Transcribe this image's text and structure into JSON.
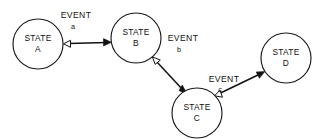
{
  "diagram": {
    "type": "state-machine",
    "background_color": "#ffffff",
    "stroke_color": "#121212",
    "states": [
      {
        "id": "A",
        "line1": "STATE",
        "line2": "A",
        "cx": 38,
        "cy": 44,
        "r": 25
      },
      {
        "id": "B",
        "line1": "STATE",
        "line2": "B",
        "cx": 136,
        "cy": 38,
        "r": 25
      },
      {
        "id": "C",
        "line1": "STATE",
        "line2": "C",
        "cx": 197,
        "cy": 113,
        "r": 25
      },
      {
        "id": "D",
        "line1": "STATE",
        "line2": "D",
        "cx": 286,
        "cy": 58,
        "r": 25
      }
    ],
    "transitions": [
      {
        "id": "a",
        "from": "A",
        "to": "B",
        "label": "EVENT",
        "sublabel": "a",
        "label_x": 76,
        "label_y": 18,
        "sublabel_x": 73,
        "sublabel_y": 29,
        "x1": 63,
        "y1": 44,
        "x2": 111,
        "y2": 42
      },
      {
        "id": "b",
        "from": "B",
        "to": "C",
        "label": "EVENT",
        "sublabel": "b",
        "label_x": 183,
        "label_y": 41,
        "sublabel_x": 179,
        "sublabel_y": 52,
        "x1": 153,
        "y1": 57,
        "x2": 186,
        "y2": 93
      },
      {
        "id": "c",
        "from": "C",
        "to": "D",
        "label": "EVENT",
        "sublabel": "c",
        "label_x": 224,
        "label_y": 82,
        "sublabel_x": 220,
        "sublabel_y": 92,
        "x1": 216,
        "y1": 95,
        "x2": 264,
        "y2": 72
      }
    ]
  }
}
